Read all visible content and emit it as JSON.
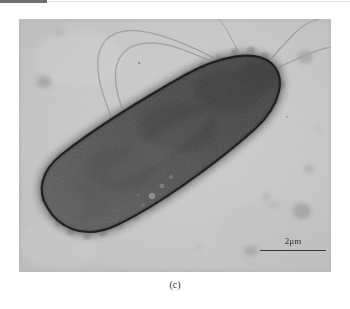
{
  "figure": {
    "panel_label": "(c)",
    "modality": "transmission-electron-micrograph",
    "scale_bar": {
      "label": "2μm",
      "length_px": 66
    },
    "colors": {
      "page_background": "#ffffff",
      "panel_background": "#c9c9c9",
      "cell_fill": "#4e4e4e",
      "cell_outline": "#141414",
      "halo": "#8d8d8d",
      "flagella": "#9a9a9a",
      "scalebar": "#3a3a3a",
      "text": "#2b2b2b",
      "top_bar": "#6f6f6f"
    },
    "panel": {
      "x": 19,
      "y": 19,
      "width": 312,
      "height": 253
    },
    "cell": {
      "pole_lower_left": [
        42,
        215
      ],
      "pole_upper_right": [
        278,
        85
      ],
      "outline_thickness_px": 2
    },
    "artifacts": {
      "top_dark_bar": {
        "x": 0,
        "y": 0,
        "width": 47,
        "height": 3
      }
    }
  }
}
